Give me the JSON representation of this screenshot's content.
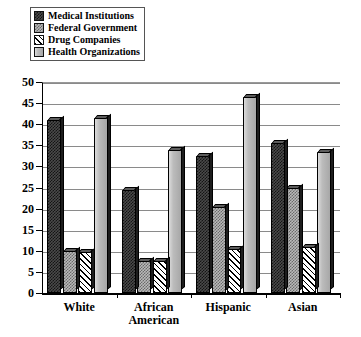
{
  "chart_data": {
    "type": "bar",
    "title": "",
    "xlabel": "",
    "ylabel": "",
    "ylim": [
      0,
      50
    ],
    "ytick_step": 5,
    "yticks": [
      "0",
      "5",
      "10",
      "15",
      "20",
      "25",
      "30",
      "35",
      "40",
      "45",
      "50"
    ],
    "grid": true,
    "legend_position": "top-left",
    "categories": [
      "White",
      "African American",
      "Hispanic",
      "Asian"
    ],
    "category_lines": [
      [
        "White"
      ],
      [
        "African",
        "American"
      ],
      [
        "Hispanic"
      ],
      [
        "Asian"
      ]
    ],
    "series": [
      {
        "name": "Medical Institutions",
        "pattern": "dark-checker",
        "color": "#3b3b3b",
        "values": [
          41.0,
          24.5,
          32.5,
          35.5
        ]
      },
      {
        "name": "Federal Government",
        "pattern": "gray-dotted",
        "color": "#b9b9b9",
        "values": [
          10.0,
          7.5,
          20.5,
          25.0
        ]
      },
      {
        "name": "Drug Companies",
        "pattern": "diagonal-hatch",
        "color": "#ffffff",
        "values": [
          9.8,
          7.5,
          10.5,
          11.0
        ]
      },
      {
        "name": "Health Organizations",
        "pattern": "solid-gray",
        "color": "#b0b0b0",
        "values": [
          41.5,
          34.0,
          46.5,
          33.5
        ]
      }
    ]
  }
}
